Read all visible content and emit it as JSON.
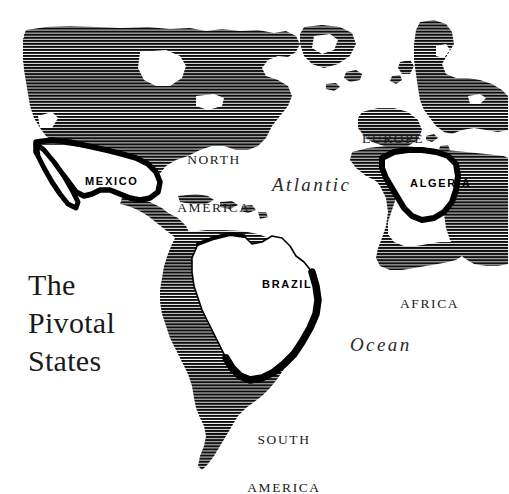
{
  "figure": {
    "kind": "map-figure",
    "background_color": "#ffffff",
    "ink_color": "#000000",
    "width": 509,
    "height": 494
  },
  "title": {
    "line1": "The",
    "line2": "Pivotal",
    "line3": "States",
    "full": "The Pivotal States"
  },
  "map": {
    "projection_note": "Atlantic-centered world map, Americas at left, Europe and Africa at right",
    "land_fill_style": "horizontal-line-hatch",
    "highlight_fill_style": "white-with-heavy-black-outline",
    "continents": [
      {
        "id": "north-america",
        "label": "NORTH\nAMERICA",
        "line1": "NORTH",
        "line2": "AMERICA",
        "x": 214,
        "y": 128
      },
      {
        "id": "south-america",
        "label": "SOUTH\nAMERICA",
        "line1": "SOUTH",
        "line2": "AMERICA",
        "x": 249,
        "y": 408
      },
      {
        "id": "europe",
        "label": "EUROPE",
        "line1": "EUROPE",
        "line2": "",
        "x": 364,
        "y": 100
      },
      {
        "id": "africa",
        "label": "AFRICA",
        "line1": "AFRICA",
        "line2": "",
        "x": 402,
        "y": 265
      }
    ],
    "oceans": [
      {
        "id": "atlantic-ocean",
        "word1": "Atlantic",
        "word2": "Ocean",
        "atlantic_x": 272,
        "atlantic_y": 174,
        "ocean_x": 350,
        "ocean_y": 335
      }
    ],
    "pivotal_states": [
      {
        "id": "mexico",
        "label": "MEXICO",
        "x": 85,
        "y": 175,
        "highlighted": true
      },
      {
        "id": "brazil",
        "label": "BRAZIL",
        "x": 262,
        "y": 278,
        "highlighted": true
      },
      {
        "id": "algeria",
        "label": "ALGERIA",
        "x": 411,
        "y": 177,
        "highlighted": true
      }
    ]
  }
}
